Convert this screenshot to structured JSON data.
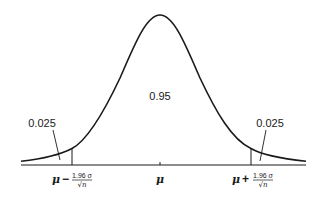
{
  "diagram": {
    "type": "normal-distribution-confidence-interval",
    "center_area_label": "0.95",
    "left_tail_label": "0.025",
    "right_tail_label": "0.025",
    "axis_labels": {
      "left": {
        "symbol": "μ",
        "operator": "−",
        "numerator": "1.96 σ",
        "denominator": "√n"
      },
      "center": {
        "symbol": "μ"
      },
      "right": {
        "symbol": "μ",
        "operator": "+",
        "numerator": "1.96 σ",
        "denominator": "√n"
      }
    },
    "colors": {
      "stroke": "#1a1a1a",
      "background": "#ffffff"
    }
  }
}
